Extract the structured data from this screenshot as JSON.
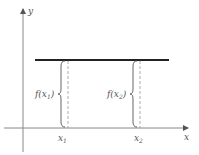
{
  "axes": {
    "x_label": "x",
    "y_label": "y"
  },
  "function": {
    "type": "constant",
    "description": "horizontal line y = f(x) = c"
  },
  "points": [
    {
      "x_label": "x",
      "x_sub": "1",
      "f_label_pre": "f(x",
      "f_label_sub": "1",
      "f_label_post": ")"
    },
    {
      "x_label": "x",
      "x_sub": "2",
      "f_label_pre": "f(x",
      "f_label_sub": "2",
      "f_label_post": ")"
    }
  ],
  "colors": {
    "axis": "#777777",
    "function_line": "#222222",
    "dashed": "#888888",
    "brace": "#555555"
  }
}
